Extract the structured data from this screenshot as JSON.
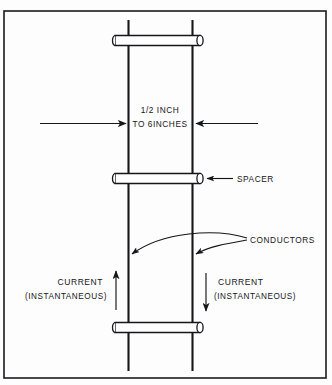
{
  "diagram": {
    "frame": {
      "stroke_color": "#1a1b1f"
    },
    "colors": {
      "line": "#15161a",
      "background": "#fdfdfd",
      "spacer_fill": "#ffffff"
    },
    "dimension": {
      "line1": "1/2 INCH",
      "line2": "TO 6INCHES",
      "left_arrow_icon": "arrow-right-icon",
      "right_arrow_icon": "arrow-left-icon"
    },
    "labels": {
      "spacer": "SPACER",
      "conductors": "CONDUCTORS"
    },
    "current_left": {
      "line1": "CURRENT",
      "line2": "(INSTANTANEOUS)",
      "arrow_icon": "arrow-up-icon",
      "direction": "up"
    },
    "current_right": {
      "line1": "CURRENT",
      "line2": "(INSTANTANEOUS)",
      "arrow_icon": "arrow-down-icon",
      "direction": "down"
    },
    "parts": {
      "conductor_left": "conductor-left",
      "conductor_right": "conductor-right",
      "spacer_top": "spacer-top",
      "spacer_middle": "spacer-middle",
      "spacer_bottom": "spacer-bottom"
    }
  }
}
